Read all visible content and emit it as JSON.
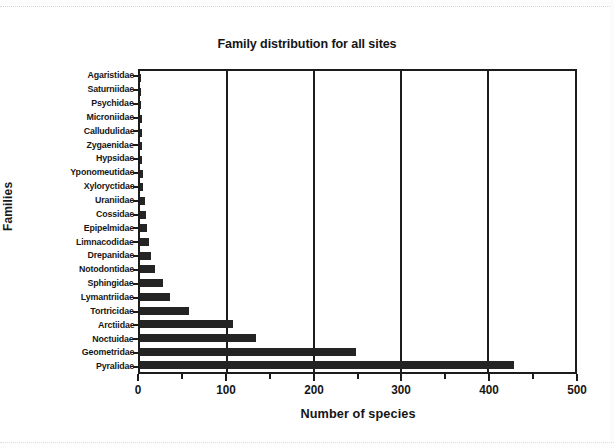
{
  "chart_data": {
    "type": "bar",
    "orientation": "horizontal",
    "title": "Family distribution for all sites",
    "xlabel": "Number of species",
    "ylabel": "Families",
    "xlim": [
      0,
      500
    ],
    "xticks": [
      0,
      100,
      200,
      300,
      400,
      500
    ],
    "xtick_labels": [
      "0",
      "100",
      "200",
      "300",
      "400",
      "500"
    ],
    "xminorticks": [
      50,
      150,
      250,
      350,
      450
    ],
    "grid": "vertical major gridlines",
    "legend": "none",
    "bar_color": "#242424",
    "axis_color": "#1c1c1c",
    "categories": [
      "Agaristidae",
      "Saturniidae",
      "Psychidae",
      "Microniidae",
      "Calludulidae",
      "Zygaenidae",
      "Hypsidae",
      "Yponomeutidae",
      "Xyloryctidae",
      "Uraniidae",
      "Cossidae",
      "Epipelmidae",
      "Limnacodidae",
      "Drepanidae",
      "Notodontidae",
      "Sphingidae",
      "Lymantriidae",
      "Tortricidae",
      "Arctiidae",
      "Noctuidae",
      "Geometridae",
      "Pyralidae"
    ],
    "values": [
      1,
      1,
      1,
      2,
      2,
      2,
      2,
      3,
      4,
      6,
      7,
      8,
      10,
      13,
      17,
      26,
      34,
      56,
      107,
      133,
      248,
      430
    ]
  }
}
